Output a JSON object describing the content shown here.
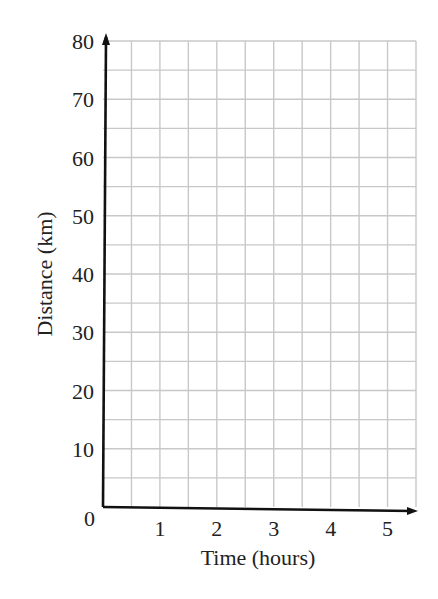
{
  "chart_data": {
    "type": "line",
    "title": "",
    "xlabel": "Time (hours)",
    "ylabel": "Distance (km)",
    "xlim": [
      0,
      5.5
    ],
    "ylim": [
      0,
      80
    ],
    "x_ticks": [
      1,
      2,
      3,
      4,
      5
    ],
    "y_ticks": [
      10,
      20,
      30,
      40,
      50,
      60,
      70,
      80
    ],
    "origin_label": "0",
    "grid": true,
    "grid_x_step": 0.5,
    "grid_y_step": 5,
    "series": [],
    "legend": null,
    "note": "Blank distance-time grid; no data plotted"
  },
  "colors": {
    "axis": "#111111",
    "grid": "#c8c8c8",
    "text": "#222222"
  }
}
